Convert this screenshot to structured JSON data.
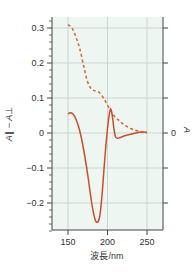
{
  "chart_data": {
    "type": "line",
    "title": "",
    "xlabel": "波長/nm",
    "ylabel": "A∥ − A⊥",
    "ylabel_right": "A",
    "xlim": [
      143,
      264
    ],
    "ylim": [
      -0.28,
      0.335
    ],
    "xticks": [
      150,
      200,
      250
    ],
    "xtick_labels": [
      "150",
      "200",
      "250"
    ],
    "yticks": [
      0.3,
      0.2,
      0.1,
      0,
      -0.1,
      -0.2
    ],
    "ytick_labels": [
      "0.3",
      "0.2",
      "0.1",
      "0",
      "−0.1",
      "−0.2"
    ],
    "right_yticks_labels": [
      "0"
    ],
    "grid": true,
    "background": "#eef6f1",
    "series": [
      {
        "name": "A (absorbance)",
        "style": "dashed",
        "color": "#d9642a",
        "x": [
          150,
          155,
          160,
          165,
          170,
          175,
          180,
          185,
          190,
          195,
          200,
          205,
          210,
          215,
          220,
          225,
          230,
          235,
          240,
          245,
          250
        ],
        "values": [
          0.31,
          0.3,
          0.275,
          0.24,
          0.19,
          0.145,
          0.125,
          0.12,
          0.115,
          0.1,
          0.08,
          0.06,
          0.045,
          0.035,
          0.025,
          0.018,
          0.012,
          0.008,
          0.005,
          0.002,
          0.0
        ]
      },
      {
        "name": "A∥ − A⊥ (linear dichroism)",
        "style": "solid",
        "color": "#d04a2a",
        "x": [
          150,
          153,
          156,
          160,
          165,
          170,
          175,
          180,
          184,
          187,
          190,
          193,
          196,
          199,
          202,
          204,
          206,
          208,
          210,
          213,
          217,
          222,
          228,
          234,
          240,
          245,
          250
        ],
        "values": [
          0.055,
          0.058,
          0.055,
          0.04,
          0.005,
          -0.05,
          -0.12,
          -0.2,
          -0.245,
          -0.255,
          -0.24,
          -0.18,
          -0.09,
          -0.01,
          0.05,
          0.07,
          0.05,
          0.015,
          -0.01,
          -0.015,
          -0.012,
          -0.008,
          -0.004,
          -0.001,
          0.002,
          0.003,
          0.002
        ]
      }
    ]
  }
}
